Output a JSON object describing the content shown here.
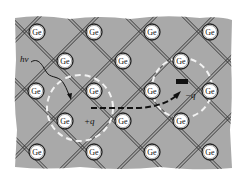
{
  "diagram": {
    "colors": {
      "background": "#ffffff",
      "lattice_fill": "#a9a9a9",
      "bond": "#2b2b2b",
      "atom_fill": "#ffffff",
      "atom_stroke": "#222222",
      "dashed_circle": "#f2f2f2",
      "path": "#111111",
      "electron": "#111111"
    },
    "atom_label": "Ge",
    "atoms": [
      {
        "x": 37,
        "y": 32
      },
      {
        "x": 94,
        "y": 32
      },
      {
        "x": 152,
        "y": 32
      },
      {
        "x": 210,
        "y": 32
      },
      {
        "x": 65,
        "y": 61
      },
      {
        "x": 123,
        "y": 61
      },
      {
        "x": 181,
        "y": 61
      },
      {
        "x": 36,
        "y": 91
      },
      {
        "x": 94,
        "y": 91
      },
      {
        "x": 152,
        "y": 91
      },
      {
        "x": 210,
        "y": 91
      },
      {
        "x": 65,
        "y": 121
      },
      {
        "x": 123,
        "y": 121
      },
      {
        "x": 181,
        "y": 121
      },
      {
        "x": 37,
        "y": 152
      },
      {
        "x": 94,
        "y": 152
      },
      {
        "x": 152,
        "y": 152
      },
      {
        "x": 210,
        "y": 152
      }
    ],
    "labels": {
      "photon": "hν",
      "hole": "+q",
      "electron": "−q"
    },
    "regions": {
      "hole_circle": {
        "cx": 80,
        "cy": 108,
        "r": 33
      },
      "electron_circle": {
        "cx": 182,
        "cy": 88,
        "r": 30
      }
    }
  }
}
